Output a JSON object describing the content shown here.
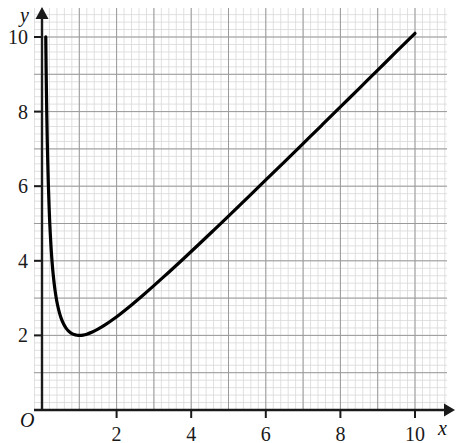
{
  "chart_data": {
    "type": "line",
    "title": "",
    "subtitle": "",
    "xlabel": "x",
    "ylabel": "y",
    "origin_label": "O",
    "xlim": [
      0,
      11.1
    ],
    "ylim": [
      0,
      10.8
    ],
    "xticks": [
      2,
      4,
      6,
      8,
      10
    ],
    "xtick_labels": [
      "2",
      "4",
      "6",
      "8",
      "10"
    ],
    "yticks": [
      2,
      4,
      6,
      8,
      10
    ],
    "ytick_labels": [
      "2",
      "4",
      "6",
      "8",
      "10"
    ],
    "grid": true,
    "grid_major_step": 1,
    "grid_minor_step": 0.2,
    "legend": "none",
    "curve_color": "#000000",
    "curve_width": 3.2,
    "grid_major_color": "#9a9a9a",
    "grid_minor_color": "#d8d8d8",
    "axis_color": "#1a1a1a",
    "function": "y = x + 1/x",
    "minimum_point": [
      1,
      2
    ],
    "series": [
      {
        "name": "y = x + 1/x",
        "x": [
          0.101,
          0.11,
          0.12,
          0.13,
          0.14,
          0.15,
          0.17,
          0.19,
          0.21,
          0.24,
          0.27,
          0.3,
          0.34,
          0.38,
          0.42,
          0.47,
          0.52,
          0.58,
          0.64,
          0.7,
          0.78,
          0.86,
          0.94,
          1.0,
          1.1,
          1.2,
          1.35,
          1.5,
          1.7,
          1.9,
          2.1,
          2.4,
          2.7,
          3.0,
          3.4,
          3.8,
          4.2,
          4.6,
          5.0,
          5.5,
          6.0,
          6.5,
          7.0,
          7.5,
          8.0,
          8.5,
          9.0,
          9.5,
          10.0
        ],
        "y": [
          10.002,
          9.202,
          8.453,
          7.822,
          7.284,
          6.817,
          6.053,
          5.454,
          4.971,
          4.407,
          3.973,
          3.633,
          3.281,
          3.012,
          2.801,
          2.598,
          2.443,
          2.304,
          2.203,
          2.129,
          2.062,
          2.023,
          2.004,
          2.0,
          2.009,
          2.033,
          2.091,
          2.167,
          2.288,
          2.426,
          2.576,
          2.817,
          3.07,
          3.333,
          3.694,
          4.063,
          4.438,
          4.817,
          5.2,
          5.682,
          6.167,
          6.654,
          7.143,
          7.633,
          8.125,
          8.618,
          9.111,
          9.605,
          10.1
        ]
      }
    ]
  },
  "axes": {
    "y_axis_name": "y",
    "x_axis_name": "x",
    "origin": "O"
  }
}
